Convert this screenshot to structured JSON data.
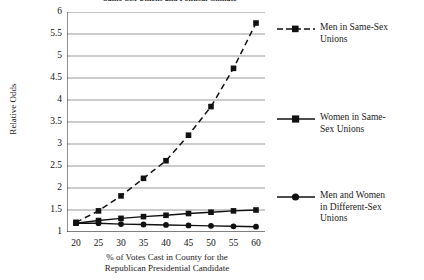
{
  "title_clipped": "Same-Sex Unions and Political Climate",
  "axes": {
    "ylabel": "Relative Odds",
    "xlabel_line1": "% of Votes Cast in County for the",
    "xlabel_line2": "Republican Presidential Candidate",
    "yticks": [
      "6",
      "5.5",
      "5",
      "4.5",
      "4",
      "3.5",
      "3",
      "2.5",
      "2",
      "1.5",
      "1"
    ],
    "xticks": [
      "20",
      "25",
      "30",
      "35",
      "40",
      "45",
      "50",
      "55",
      "60"
    ]
  },
  "legend": {
    "items": [
      {
        "label_line1": "Men in Same-Sex",
        "label_line2": "Unions",
        "style": "dashed",
        "marker": "square"
      },
      {
        "label_line1": "Women in Same-",
        "label_line2": "Sex Unions",
        "style": "solid",
        "marker": "square"
      },
      {
        "label_line1": "Men and Women",
        "label_line2": "in Different-Sex",
        "label_line3": "Unions",
        "style": "solid",
        "marker": "circle"
      }
    ]
  },
  "chart_data": {
    "type": "line",
    "title": "Same-Sex Unions and Political Climate",
    "xlabel": "% of Votes Cast in County for the Republican Presidential Candidate",
    "ylabel": "Relative Odds",
    "x": [
      20,
      25,
      30,
      35,
      40,
      45,
      50,
      55,
      60
    ],
    "xlim": [
      18,
      62
    ],
    "ylim": [
      1,
      6
    ],
    "grid": "horizontal",
    "legend_position": "right",
    "series": [
      {
        "name": "Men in Same-Sex Unions",
        "marker": "square",
        "linestyle": "dashed",
        "color": "#111111",
        "values": [
          1.22,
          1.48,
          1.82,
          2.22,
          2.62,
          3.2,
          3.85,
          4.72,
          5.75
        ]
      },
      {
        "name": "Women in Same-Sex Unions",
        "marker": "square",
        "linestyle": "solid",
        "color": "#111111",
        "values": [
          1.2,
          1.26,
          1.31,
          1.35,
          1.38,
          1.42,
          1.45,
          1.48,
          1.5
        ]
      },
      {
        "name": "Men and Women in Different-Sex Unions",
        "marker": "circle",
        "linestyle": "solid",
        "color": "#111111",
        "values": [
          1.2,
          1.2,
          1.18,
          1.17,
          1.16,
          1.15,
          1.14,
          1.13,
          1.12
        ]
      }
    ]
  }
}
